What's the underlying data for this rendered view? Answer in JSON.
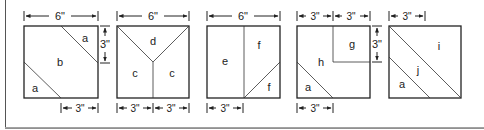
{
  "diagram": {
    "type": "quilt-block-cutting-diagrams",
    "blocks": [
      {
        "id": "block-1",
        "width_label": "6\"",
        "side_label": "3\"",
        "bottom_labels": [
          "3\""
        ],
        "pieces": [
          "a",
          "b",
          "a"
        ]
      },
      {
        "id": "block-2",
        "width_label": "6\"",
        "bottom_labels": [
          "3\"",
          "3\""
        ],
        "pieces": [
          "d",
          "c",
          "c"
        ]
      },
      {
        "id": "block-3",
        "width_label": "6\"",
        "bottom_labels": [
          "3\""
        ],
        "pieces": [
          "e",
          "f",
          "f"
        ]
      },
      {
        "id": "block-4",
        "top_labels": [
          "3\"",
          "3\""
        ],
        "side_label": "3\"",
        "bottom_labels": [
          "3\""
        ],
        "pieces": [
          "g",
          "h",
          "a"
        ]
      },
      {
        "id": "block-5",
        "top_labels": [
          "3\""
        ],
        "pieces": [
          "i",
          "j",
          "a"
        ]
      }
    ]
  },
  "colors": {
    "line": "#222222",
    "background": "#ffffff"
  }
}
